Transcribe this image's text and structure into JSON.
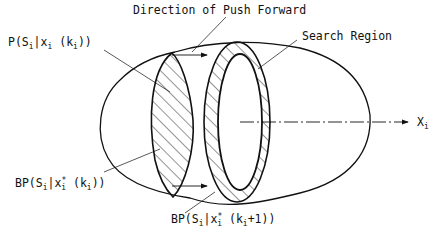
{
  "diagram": {
    "labels": {
      "direction": "Direction of Push Forward",
      "search_region": "Search Region",
      "axis": {
        "main": "X",
        "sub": "i"
      },
      "prior": {
        "pre": "P(S",
        "s1": "i",
        "mid": "|x",
        "s2": "i",
        "mid2": " (k",
        "s3": "i",
        "post": "))"
      },
      "bp_k": {
        "pre": "BP(S",
        "s1": "i",
        "mid": "|x",
        "sup": "*",
        "s2": "i",
        "mid2": " (k",
        "s3": "i",
        "post": "))"
      },
      "bp_k1": {
        "pre": "BP(S",
        "s1": "i",
        "mid": "|x",
        "sup": "*",
        "s2": "i",
        "mid2": " (k",
        "s3": "i",
        "post": "+1))"
      }
    },
    "colors": {
      "ink": "#111111",
      "background": "#ffffff"
    }
  }
}
